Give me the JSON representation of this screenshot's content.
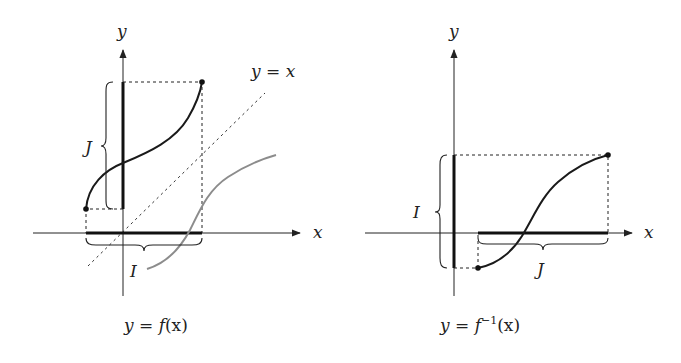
{
  "figure": {
    "left_panel": {
      "caption": {
        "lhs": "y",
        "eq": " = ",
        "fn": "f",
        "arg": "(x)"
      },
      "axis_labels": {
        "x": "x",
        "y": "y"
      },
      "diagonal_label": {
        "lhs": "y",
        "eq": " = ",
        "rhs": "x"
      },
      "interval_labels": {
        "domain": "I",
        "range": "J"
      },
      "reflected_curve_color": "#8c8c8c"
    },
    "right_panel": {
      "caption": {
        "lhs": "y",
        "eq": " = ",
        "fn": "f",
        "sup": "−1",
        "arg": "(x)"
      },
      "axis_labels": {
        "x": "x",
        "y": "y"
      },
      "interval_labels": {
        "domain": "J",
        "range": "I"
      }
    },
    "colors": {
      "ink": "#222222",
      "reflected": "#8c8c8c"
    }
  }
}
